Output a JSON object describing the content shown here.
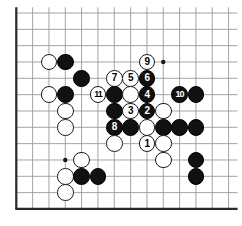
{
  "figure": {
    "kind": "go-board-diagram",
    "board_size": 13,
    "visible_columns": 14,
    "visible_rows": 13,
    "colors": {
      "background": "#ffffff",
      "grid_line": "#9a9a9a",
      "border_line": "#2a2a2a",
      "black_stone": "#111111",
      "white_stone": "#ffffff",
      "stone_outline": "#1a1a1a",
      "star_point": "#1a1a1a"
    },
    "geometry": {
      "origin_x": 16.3,
      "origin_y": 13.0,
      "spacing": 16.33,
      "stone_diameter": 16.6,
      "cols": 14,
      "rows": 13
    },
    "star_points": [
      {
        "col": 4,
        "row": 4
      },
      {
        "col": 10,
        "row": 4
      },
      {
        "col": 4,
        "row": 10
      }
    ],
    "border": {
      "left_col": 1,
      "bottom_row": 13,
      "thick_px": 2.2
    }
  },
  "stones": [
    {
      "id": "b-c4r4",
      "color": "black",
      "col": 4,
      "row": 4,
      "label": ""
    },
    {
      "id": "w-c3r4",
      "color": "white",
      "col": 3,
      "row": 4,
      "label": ""
    },
    {
      "id": "b-c5r5",
      "color": "black",
      "col": 5,
      "row": 5,
      "label": ""
    },
    {
      "id": "w-c3r6",
      "color": "white",
      "col": 3,
      "row": 6,
      "label": ""
    },
    {
      "id": "b-c4r6",
      "color": "black",
      "col": 4,
      "row": 6,
      "label": ""
    },
    {
      "id": "w-c4r7",
      "color": "white",
      "col": 4,
      "row": 7,
      "label": ""
    },
    {
      "id": "w-c4r8",
      "color": "white",
      "col": 4,
      "row": 8,
      "label": ""
    },
    {
      "id": "w-c5r10",
      "color": "white",
      "col": 5,
      "row": 10,
      "label": ""
    },
    {
      "id": "w-c4r11",
      "color": "white",
      "col": 4,
      "row": 11,
      "label": ""
    },
    {
      "id": "b-c5r11",
      "color": "black",
      "col": 5,
      "row": 11,
      "label": ""
    },
    {
      "id": "b-c6r11",
      "color": "black",
      "col": 6,
      "row": 11,
      "label": ""
    },
    {
      "id": "w-c4r12",
      "color": "white",
      "col": 4,
      "row": 12,
      "label": ""
    },
    {
      "id": "m11",
      "color": "white",
      "col": 6,
      "row": 6,
      "label": "11"
    },
    {
      "id": "m7",
      "color": "white",
      "col": 7,
      "row": 5,
      "label": "7"
    },
    {
      "id": "m5",
      "color": "white",
      "col": 8,
      "row": 5,
      "label": "5"
    },
    {
      "id": "m6",
      "color": "black",
      "col": 9,
      "row": 5,
      "label": "6"
    },
    {
      "id": "m9",
      "color": "white",
      "col": 9,
      "row": 4,
      "label": "9"
    },
    {
      "id": "b-c7r6",
      "color": "black",
      "col": 7,
      "row": 6,
      "label": ""
    },
    {
      "id": "w-c8r6",
      "color": "white",
      "col": 8,
      "row": 6,
      "label": ""
    },
    {
      "id": "m4",
      "color": "black",
      "col": 9,
      "row": 6,
      "label": "4"
    },
    {
      "id": "b-c7r7",
      "color": "black",
      "col": 7,
      "row": 7,
      "label": ""
    },
    {
      "id": "m3",
      "color": "white",
      "col": 8,
      "row": 7,
      "label": "3"
    },
    {
      "id": "m2",
      "color": "black",
      "col": 9,
      "row": 7,
      "label": "2"
    },
    {
      "id": "w-c10r7",
      "color": "white",
      "col": 10,
      "row": 7,
      "label": ""
    },
    {
      "id": "m8",
      "color": "black",
      "col": 7,
      "row": 8,
      "label": "8"
    },
    {
      "id": "b-c8r8",
      "color": "black",
      "col": 8,
      "row": 8,
      "label": ""
    },
    {
      "id": "w-c9r8",
      "color": "white",
      "col": 9,
      "row": 8,
      "label": ""
    },
    {
      "id": "b-c10r8",
      "color": "black",
      "col": 10,
      "row": 8,
      "label": ""
    },
    {
      "id": "b-c11r8",
      "color": "black",
      "col": 11,
      "row": 8,
      "label": ""
    },
    {
      "id": "b-c12r8",
      "color": "black",
      "col": 12,
      "row": 8,
      "label": ""
    },
    {
      "id": "w-c7r9",
      "color": "white",
      "col": 7,
      "row": 9,
      "label": ""
    },
    {
      "id": "m1",
      "color": "white",
      "col": 9,
      "row": 9,
      "label": "1"
    },
    {
      "id": "w-c10r9",
      "color": "white",
      "col": 10,
      "row": 9,
      "label": ""
    },
    {
      "id": "w-c10r10",
      "color": "white",
      "col": 10,
      "row": 10,
      "label": ""
    },
    {
      "id": "m10",
      "color": "black",
      "col": 11,
      "row": 6,
      "label": "10"
    },
    {
      "id": "b-c12r6",
      "color": "black",
      "col": 12,
      "row": 6,
      "label": ""
    },
    {
      "id": "b-c12r10",
      "color": "black",
      "col": 12,
      "row": 10,
      "label": ""
    },
    {
      "id": "b-c12r11",
      "color": "black",
      "col": 12,
      "row": 11,
      "label": ""
    }
  ],
  "move_numbers": [
    "1",
    "2",
    "3",
    "4",
    "5",
    "6",
    "7",
    "8",
    "9",
    "10",
    "11"
  ]
}
